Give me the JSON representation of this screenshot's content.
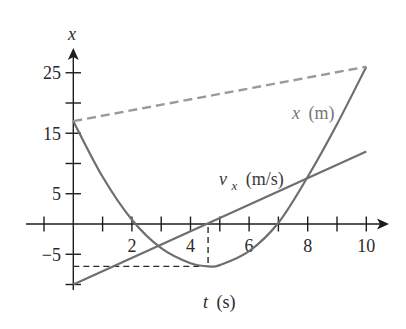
{
  "chart_data": {
    "type": "line",
    "title": "",
    "xlabel": "t (s)",
    "ylabel": "x",
    "xlim": [
      -1.6,
      10.8
    ],
    "ylim": [
      -11,
      29
    ],
    "grid": false,
    "legend": "none (inline curve labels)",
    "x_ticks": [
      -1,
      1,
      2,
      3,
      4,
      5,
      6,
      7,
      8,
      9,
      10
    ],
    "x_tick_labels": [
      {
        "value": 2,
        "text": "2"
      },
      {
        "value": 4,
        "text": "4"
      },
      {
        "value": 6,
        "text": "6"
      },
      {
        "value": 8,
        "text": "8"
      },
      {
        "value": 10,
        "text": "10"
      }
    ],
    "y_ticks": [
      -10,
      -5,
      5,
      10,
      15,
      20,
      25
    ],
    "y_tick_labels": [
      {
        "value": 25,
        "text": "25"
      },
      {
        "value": 15,
        "text": "15"
      },
      {
        "value": 5,
        "text": "5"
      },
      {
        "value": -5,
        "text": "−5"
      }
    ],
    "series": [
      {
        "name": "x (m)",
        "style": "solid",
        "color": "#6e6e6e",
        "t": [
          0,
          1,
          2,
          3,
          4,
          4.6,
          5,
          6,
          7,
          8,
          9,
          10
        ],
        "values": [
          17,
          7.8,
          0.7,
          -4,
          -6.5,
          -7,
          -6.8,
          -4.5,
          0.2,
          7.8,
          16.5,
          26
        ]
      },
      {
        "name": "v_x (m/s)",
        "style": "solid",
        "color": "#6e6e6e",
        "t": [
          0,
          10
        ],
        "values": [
          -10,
          12
        ]
      },
      {
        "name": "average-velocity secant",
        "style": "dashed",
        "color": "#9a9a9a",
        "t": [
          0,
          10
        ],
        "values": [
          17,
          26
        ]
      }
    ],
    "annotations": [
      {
        "type": "hline-dashed",
        "y": -7,
        "x_from": 0,
        "x_to": 4.6,
        "color": "#2a2a2a"
      },
      {
        "type": "vline-dashed",
        "x": 4.6,
        "y_from": 0,
        "y_to": -7,
        "color": "#2a2a2a"
      }
    ]
  },
  "labels": {
    "y_axis": "x",
    "x_axis_var": "t",
    "x_axis_unit": "(s)",
    "x_curve_var": "x",
    "x_curve_unit": "(m)",
    "v_curve_var": "v",
    "v_curve_sub": "x",
    "v_curve_unit": "(m/s)"
  }
}
